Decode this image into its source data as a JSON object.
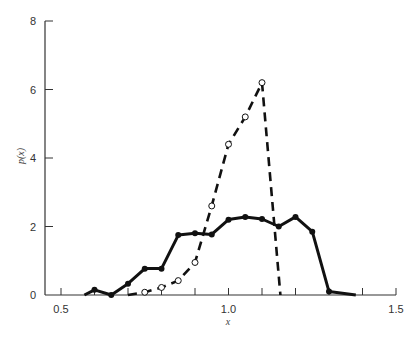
{
  "chart_data": {
    "type": "line",
    "title": "",
    "xlabel": "x",
    "ylabel": "p(x)",
    "xlim": [
      0.5,
      1.5
    ],
    "ylim": [
      0,
      8
    ],
    "x_ticks": [
      0.5,
      1.0,
      1.5
    ],
    "x_tick_labels": [
      "0.5",
      "1.0",
      "1.5"
    ],
    "x_minor_step": 0.1,
    "y_ticks": [
      0,
      2,
      4,
      6,
      8
    ],
    "y_tick_labels": [
      "0",
      "2",
      "4",
      "6",
      "8"
    ],
    "grid": false,
    "legend": null,
    "series": [
      {
        "name": "solid (filled markers)",
        "style": "solid",
        "marker": "filled-circle",
        "x": [
          0.57,
          0.6,
          0.65,
          0.7,
          0.75,
          0.8,
          0.85,
          0.9,
          0.95,
          1.0,
          1.05,
          1.1,
          1.15,
          1.2,
          1.25,
          1.3,
          1.38
        ],
        "y": [
          0,
          0.15,
          0,
          0.33,
          0.77,
          0.77,
          1.75,
          1.8,
          1.77,
          2.2,
          2.28,
          2.22,
          2.0,
          2.28,
          1.85,
          0.1,
          0
        ],
        "markers_at": [
          1,
          2,
          3,
          4,
          5,
          6,
          7,
          8,
          9,
          10,
          11,
          12,
          13,
          14,
          15
        ]
      },
      {
        "name": "dashed (open markers)",
        "style": "dashed",
        "marker": "open-circle",
        "x": [
          0.7,
          0.75,
          0.8,
          0.85,
          0.9,
          0.95,
          1.0,
          1.05,
          1.1,
          1.155
        ],
        "y": [
          0,
          0.08,
          0.22,
          0.42,
          0.95,
          2.6,
          4.4,
          5.2,
          6.2,
          0
        ],
        "markers_at": [
          1,
          2,
          3,
          4,
          5,
          6,
          7,
          8
        ]
      }
    ]
  }
}
